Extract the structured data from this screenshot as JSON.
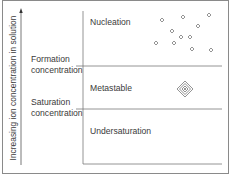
{
  "diagram": {
    "y_axis_label": "Increasing ion concentration in solution",
    "thresholds": [
      {
        "label_line1": "Formation",
        "label_line2": "concentration"
      },
      {
        "label_line1": "Saturation",
        "label_line2": "concentration"
      }
    ],
    "regions": [
      {
        "name": "Nucleation"
      },
      {
        "name": "Metastable"
      },
      {
        "name": "Undersaturation"
      }
    ],
    "icons": {
      "nucleation_particles": "small-diamond-icon",
      "metastable_crystal": "concentric-diamond-icon"
    },
    "colors": {
      "line": "#7a7a7a",
      "text": "#3a3a3a",
      "border": "#8a8a8a"
    }
  }
}
